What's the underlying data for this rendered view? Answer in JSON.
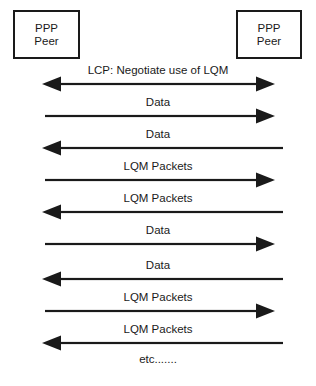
{
  "diagram": {
    "width": 316,
    "height": 386,
    "background": "#ffffff",
    "stroke_color": "#1a1a1a",
    "text_color": "#1a1a1a"
  },
  "peers": {
    "left": {
      "line1": "PPP",
      "line2": "Peer"
    },
    "right": {
      "line1": "PPP",
      "line2": "Peer"
    }
  },
  "messages": [
    {
      "label": "LCP: Negotiate use of LQM",
      "direction": "both",
      "y": 77
    },
    {
      "label": "Data",
      "direction": "right",
      "y": 109
    },
    {
      "label": "Data",
      "direction": "left",
      "y": 141
    },
    {
      "label": "LQM Packets",
      "direction": "right",
      "y": 173
    },
    {
      "label": "LQM Packets",
      "direction": "left",
      "y": 205
    },
    {
      "label": "Data",
      "direction": "right",
      "y": 237
    },
    {
      "label": "Data",
      "direction": "left",
      "y": 272
    },
    {
      "label": "LQM Packets",
      "direction": "right",
      "y": 304
    },
    {
      "label": "LQM Packets",
      "direction": "left",
      "y": 336
    }
  ],
  "footer": {
    "etc": "etc.......",
    "y": 360
  },
  "geometry": {
    "left_tip": 42,
    "right_tip": 275,
    "left_tail": 45,
    "right_tail": 283,
    "head_len": 19,
    "head_half": 7.5,
    "line_thickness": 2.2
  }
}
